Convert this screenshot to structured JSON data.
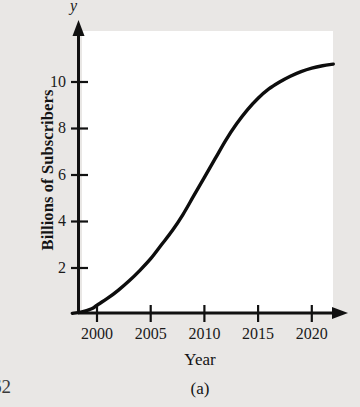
{
  "figure": {
    "caption": "(a)",
    "folio": "62",
    "axis_variable_y": "y"
  },
  "chart_data": {
    "type": "line",
    "title": "",
    "xlabel": "Year",
    "ylabel": "Billions of Subscribers",
    "xlim": [
      1997.5,
      2022
    ],
    "ylim": [
      0,
      11.8
    ],
    "grid": false,
    "legend": "none",
    "xticks": [
      2000,
      2005,
      2010,
      2015,
      2020
    ],
    "xtick_labels": [
      "2000",
      "2005",
      "2010",
      "2015",
      "2020"
    ],
    "yticks": [
      2,
      4,
      6,
      8,
      10
    ],
    "ytick_labels": [
      "2",
      "4",
      "6",
      "8",
      "10"
    ],
    "series": [
      {
        "name": "Mobile subscribers",
        "x": [
          1997.7,
          1998.5,
          1999.5,
          2000,
          2001,
          2002,
          2003,
          2004,
          2005,
          2006,
          2007,
          2008,
          2009,
          2010,
          2011,
          2012,
          2013,
          2014,
          2015,
          2016,
          2017,
          2018,
          2019,
          2020,
          2021,
          2022
        ],
        "values": [
          0.05,
          0.1,
          0.25,
          0.4,
          0.7,
          1.05,
          1.45,
          1.9,
          2.4,
          3.0,
          3.6,
          4.3,
          5.1,
          5.9,
          6.7,
          7.5,
          8.2,
          8.8,
          9.3,
          9.7,
          10.0,
          10.25,
          10.45,
          10.6,
          10.7,
          10.77
        ]
      }
    ]
  }
}
